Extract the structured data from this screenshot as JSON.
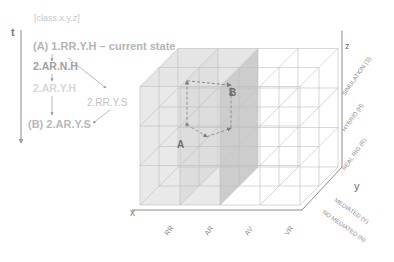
{
  "legend": {
    "notation": "[class.x.y.z]",
    "time_axis_label": "t",
    "states": [
      {
        "text": "(A) 1.RR.Y.H – current state",
        "emphasis": "start"
      },
      {
        "text": "2.AR.N.H",
        "emphasis": "normal"
      },
      {
        "text": "2.AR.Y.H",
        "emphasis": "faded"
      },
      {
        "text": "2.RR.Y.S",
        "emphasis": "faded"
      },
      {
        "text": "(B) 2.AR.Y.S",
        "emphasis": "end"
      }
    ],
    "transitions": [
      {
        "from": "(A) 1.RR.Y.H",
        "to": "2.AR.N.H"
      },
      {
        "from": "(A) 1.RR.Y.H",
        "to": "2.RR.Y.S"
      },
      {
        "from": "2.AR.N.H",
        "to": "2.AR.Y.H"
      },
      {
        "from": "2.AR.Y.H",
        "to": "(B) 2.AR.Y.S"
      },
      {
        "from": "2.RR.Y.S",
        "to": "(B) 2.AR.Y.S"
      }
    ]
  },
  "cube": {
    "axes": {
      "x": {
        "label": "x",
        "categories": [
          "RR",
          "AR",
          "AV",
          "VR"
        ]
      },
      "y": {
        "label": "y",
        "categories": [
          "NO MEDIATED (N)",
          "MEDIATED (Y)"
        ]
      },
      "z": {
        "label": "z",
        "categories": [
          "REAL RIG (R)",
          "HYBRID (H)",
          "SIMULATION (S)"
        ]
      }
    },
    "points": [
      {
        "label": "A",
        "state": "1.RR.Y.H"
      },
      {
        "label": "B",
        "state": "2.AR.Y.S"
      }
    ],
    "highlighted_columns": [
      "RR",
      "AR"
    ]
  },
  "colors": {
    "text_dark": "#9a9a9a",
    "text_faded": "#cfcfcf",
    "grid_line": "#bdbdbd",
    "axis_line": "#8c8c8c",
    "shade_light": "#e2e2e2",
    "shade_dark": "#c4c4c4",
    "path": "#8a8a8a"
  }
}
